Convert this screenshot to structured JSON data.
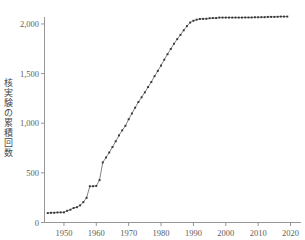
{
  "chart_data": {
    "type": "line",
    "title": "",
    "subtitle": "",
    "xlabel": "",
    "ylabel": "核実験の累積回数",
    "xlim": [
      1944,
      2022
    ],
    "ylim": [
      0,
      2100
    ],
    "grid": false,
    "legend": null,
    "marker": "square",
    "line_color": "#4e4e4e",
    "marker_color": "#333333",
    "axis_color": "#8a8a8a",
    "xticks": [
      1950,
      1960,
      1970,
      1980,
      1990,
      2000,
      2010,
      2020
    ],
    "xticklabels": [
      "1950",
      "1960",
      "1970",
      "1980",
      "1990",
      "2000",
      "2010",
      "2020"
    ],
    "yticks": [
      0,
      500,
      1000,
      1500,
      2000
    ],
    "yticklabels": [
      "0",
      "500",
      "1,000",
      "1,500",
      "2,000"
    ],
    "x": [
      1945,
      1946,
      1947,
      1948,
      1949,
      1950,
      1951,
      1952,
      1953,
      1954,
      1955,
      1956,
      1957,
      1958,
      1959,
      1960,
      1961,
      1962,
      1963,
      1964,
      1965,
      1966,
      1967,
      1968,
      1969,
      1970,
      1971,
      1972,
      1973,
      1974,
      1975,
      1976,
      1977,
      1978,
      1979,
      1980,
      1981,
      1982,
      1983,
      1984,
      1985,
      1986,
      1987,
      1988,
      1989,
      1990,
      1991,
      1992,
      1993,
      1994,
      1995,
      1996,
      1997,
      1998,
      1999,
      2000,
      2001,
      2002,
      2003,
      2004,
      2005,
      2006,
      2007,
      2008,
      2009,
      2010,
      2011,
      2012,
      2013,
      2014,
      2015,
      2016,
      2017,
      2018,
      2019
    ],
    "y": [
      95,
      98,
      98,
      101,
      102,
      102,
      118,
      129,
      146,
      154,
      173,
      205,
      249,
      365,
      365,
      368,
      427,
      605,
      655,
      705,
      760,
      818,
      877,
      928,
      974,
      1040,
      1098,
      1156,
      1213,
      1261,
      1311,
      1364,
      1415,
      1474,
      1527,
      1581,
      1640,
      1695,
      1748,
      1800,
      1847,
      1890,
      1936,
      1978,
      2014,
      2032,
      2043,
      2050,
      2051,
      2052,
      2057,
      2059,
      2059,
      2064,
      2064,
      2064,
      2064,
      2064,
      2064,
      2064,
      2064,
      2065,
      2065,
      2065,
      2067,
      2067,
      2068,
      2068,
      2071,
      2071,
      2071,
      2072,
      2074,
      2074,
      2074
    ]
  },
  "figure": {
    "background_color": "#ffffff",
    "width": 305,
    "height": 240
  }
}
